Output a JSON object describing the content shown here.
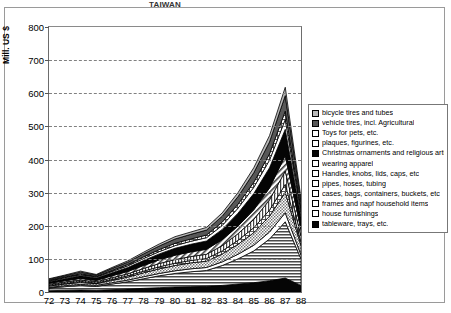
{
  "chart_data": {
    "type": "area",
    "stacked": true,
    "title": "TAIWAN",
    "ylabel": "Mill. US $",
    "xlabel": "",
    "ylim": [
      0,
      800
    ],
    "yticks": [
      0,
      100,
      200,
      300,
      400,
      500,
      600,
      700,
      800
    ],
    "grid": true,
    "legend_position": "right",
    "categories": [
      "72",
      "73",
      "74",
      "75",
      "76",
      "77",
      "78",
      "79",
      "80",
      "81",
      "82",
      "83",
      "84",
      "85",
      "86",
      "87",
      "88"
    ],
    "series": [
      {
        "name": "tableware, trays, etc.",
        "pattern": "solid-black",
        "values": [
          4,
          5,
          6,
          5,
          7,
          9,
          11,
          13,
          15,
          16,
          17,
          20,
          24,
          28,
          34,
          42,
          20
        ]
      },
      {
        "name": "house furnishings",
        "pattern": "h-lines",
        "values": [
          8,
          11,
          14,
          12,
          17,
          22,
          29,
          36,
          41,
          45,
          48,
          60,
          76,
          96,
          126,
          170,
          80
        ]
      },
      {
        "name": "frames and napf household items",
        "pattern": "white",
        "values": [
          2,
          3,
          3,
          3,
          4,
          5,
          6,
          7,
          8,
          9,
          9,
          11,
          14,
          17,
          21,
          27,
          12
        ]
      },
      {
        "name": "cases, bags, containers, buckets, etc",
        "pattern": "fine-dots",
        "values": [
          4,
          5,
          6,
          5,
          7,
          9,
          12,
          14,
          16,
          18,
          19,
          24,
          30,
          38,
          48,
          62,
          28
        ]
      },
      {
        "name": "pipes, hoses, tubing",
        "pattern": "cross-hatch",
        "values": [
          2,
          2,
          3,
          2,
          3,
          4,
          5,
          6,
          7,
          7,
          8,
          9,
          12,
          15,
          18,
          24,
          11
        ]
      },
      {
        "name": "Handles, knobs, lids, caps, etc",
        "pattern": "v-lines",
        "values": [
          3,
          4,
          4,
          4,
          5,
          6,
          8,
          10,
          11,
          12,
          13,
          16,
          20,
          25,
          31,
          40,
          18
        ]
      },
      {
        "name": "wearing apparel",
        "pattern": "diag-lines",
        "values": [
          3,
          4,
          5,
          4,
          6,
          7,
          9,
          11,
          13,
          14,
          15,
          18,
          23,
          29,
          36,
          47,
          21
        ]
      },
      {
        "name": "Christmas ornaments and religious articles",
        "pattern": "solid-black",
        "values": [
          5,
          6,
          8,
          7,
          9,
          12,
          15,
          18,
          21,
          23,
          25,
          31,
          39,
          49,
          61,
          79,
          36
        ]
      },
      {
        "name": "plaques, figurines, etc.",
        "pattern": "white",
        "values": [
          2,
          3,
          3,
          3,
          4,
          5,
          6,
          7,
          8,
          9,
          10,
          12,
          15,
          19,
          23,
          30,
          14
        ]
      },
      {
        "name": "Toys for pets, etc.",
        "pattern": "cross-hatch",
        "values": [
          2,
          2,
          3,
          2,
          3,
          4,
          5,
          6,
          7,
          7,
          8,
          10,
          12,
          15,
          19,
          25,
          11
        ]
      },
      {
        "name": "vehicle tires, incl. Agricultural",
        "pattern": "dark-gray",
        "values": [
          3,
          4,
          5,
          4,
          6,
          7,
          9,
          11,
          13,
          14,
          15,
          18,
          23,
          29,
          36,
          47,
          21
        ]
      },
      {
        "name": "bicycle tires and tubes",
        "pattern": "light-gray",
        "values": [
          2,
          2,
          3,
          2,
          3,
          4,
          5,
          6,
          7,
          7,
          8,
          10,
          12,
          15,
          19,
          25,
          11
        ]
      }
    ],
    "legend_items": [
      "bicycle tires and tubes",
      "vehicle tires, incl. Agricultural",
      "Toys for pets, etc.",
      "plaques, figurines, etc.",
      "Christmas ornaments and religious articles",
      "wearing apparel",
      "Handles, knobs, lids, caps, etc",
      "pipes, hoses, tubing",
      "cases, bags, containers, buckets, etc",
      "frames and napf household items",
      "house furnishings",
      "tableware, trays, etc."
    ],
    "legend_patterns": [
      "light-gray",
      "dark-gray",
      "cross-hatch",
      "white",
      "solid-black",
      "diag-lines",
      "v-lines",
      "cross-hatch-dark",
      "fine-dots",
      "white",
      "h-lines",
      "solid-black"
    ]
  },
  "colors": {
    "frame": "#9a9a9a",
    "axis": "#6d6d6d",
    "grid": "#808080",
    "text": "#000000",
    "background": "#ffffff"
  }
}
